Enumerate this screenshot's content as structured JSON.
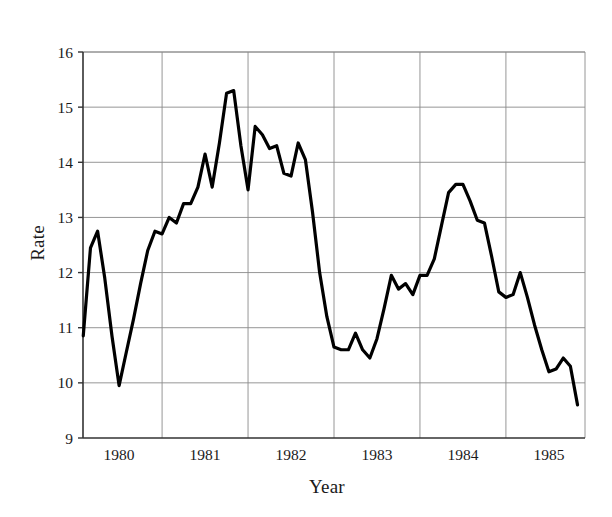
{
  "chart_data": {
    "type": "line",
    "title": "",
    "subtitle": "",
    "xlabel": "Year",
    "ylabel": "Rate",
    "xlim": [
      1979.58,
      1985.42
    ],
    "ylim": [
      9,
      16
    ],
    "grid": true,
    "legend": null,
    "y_ticks": [
      9,
      10,
      11,
      12,
      13,
      14,
      15,
      16
    ],
    "y_tick_labels": [
      "9",
      "10",
      "11",
      "12",
      "13",
      "14",
      "15",
      "16"
    ],
    "x_ticks": [
      1980,
      1981,
      1982,
      1983,
      1984,
      1985
    ],
    "x_tick_labels": [
      "1980",
      "1981",
      "1982",
      "1983",
      "1984",
      "1985"
    ],
    "x_gridlines": [
      1979.58,
      1980.5,
      1981.5,
      1982.5,
      1983.5,
      1984.5,
      1985.42
    ],
    "series": [
      {
        "name": "Rate",
        "color": "#000000",
        "line_width": 3.2,
        "x": [
          1979.583,
          1979.667,
          1979.75,
          1979.833,
          1979.917,
          1980.0,
          1980.083,
          1980.167,
          1980.25,
          1980.333,
          1980.417,
          1980.5,
          1980.583,
          1980.667,
          1980.75,
          1980.833,
          1980.917,
          1981.0,
          1981.083,
          1981.167,
          1981.25,
          1981.333,
          1981.417,
          1981.5,
          1981.583,
          1981.667,
          1981.75,
          1981.833,
          1981.917,
          1982.0,
          1982.083,
          1982.167,
          1982.25,
          1982.333,
          1982.417,
          1982.5,
          1982.583,
          1982.667,
          1982.75,
          1982.833,
          1982.917,
          1983.0,
          1983.083,
          1983.167,
          1983.25,
          1983.333,
          1983.417,
          1983.5,
          1983.583,
          1983.667,
          1983.75,
          1983.833,
          1983.917,
          1984.0,
          1984.083,
          1984.167,
          1984.25,
          1984.333,
          1984.417,
          1984.5,
          1984.583,
          1984.667,
          1984.75,
          1984.833,
          1984.917,
          1985.0,
          1985.083,
          1985.167,
          1985.25,
          1985.333
        ],
        "y": [
          10.85,
          12.45,
          12.75,
          11.9,
          10.85,
          9.95,
          10.55,
          11.15,
          11.8,
          12.4,
          12.75,
          12.7,
          13.0,
          12.9,
          13.25,
          13.25,
          13.55,
          14.15,
          13.55,
          14.35,
          15.25,
          15.3,
          14.3,
          13.5,
          14.65,
          14.5,
          14.25,
          14.3,
          13.8,
          13.75,
          14.35,
          14.05,
          13.1,
          12.0,
          11.2,
          10.65,
          10.6,
          10.6,
          10.9,
          10.6,
          10.45,
          10.8,
          11.35,
          11.95,
          11.7,
          11.8,
          11.6,
          11.95,
          11.95,
          12.25,
          12.85,
          13.45,
          13.6,
          13.6,
          13.3,
          12.95,
          12.9,
          12.3,
          11.65,
          11.55,
          11.6,
          12.0,
          11.55,
          11.05,
          10.6,
          10.2,
          10.25,
          10.45,
          10.3,
          9.6
        ]
      }
    ]
  },
  "axes": {
    "ylabel_text": "Rate",
    "xlabel_text": "Year"
  }
}
